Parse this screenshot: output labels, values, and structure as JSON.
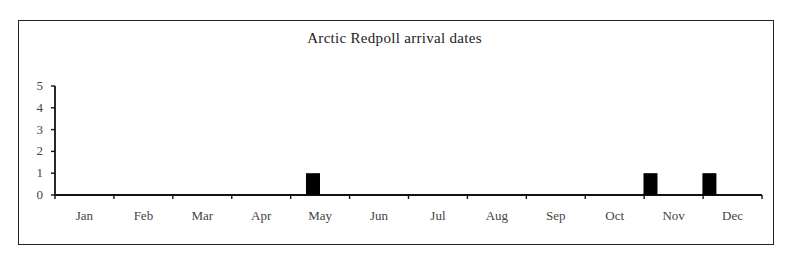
{
  "chart_data": {
    "type": "bar",
    "title": "Arctic Redpoll arrival dates",
    "xlabel": "",
    "ylabel": "",
    "categories": [
      "Jan",
      "Feb",
      "Mar",
      "Apr",
      "May",
      "Jun",
      "Jul",
      "Aug",
      "Sep",
      "Oct",
      "Nov",
      "Dec"
    ],
    "values": [
      0,
      0,
      0,
      0,
      1,
      0,
      0,
      0,
      0,
      0,
      1,
      1
    ],
    "ylim": [
      0,
      5
    ],
    "yticks": [
      0,
      1,
      2,
      3,
      4,
      5
    ],
    "grid": false,
    "legend": null,
    "bar_color": "#000000"
  }
}
